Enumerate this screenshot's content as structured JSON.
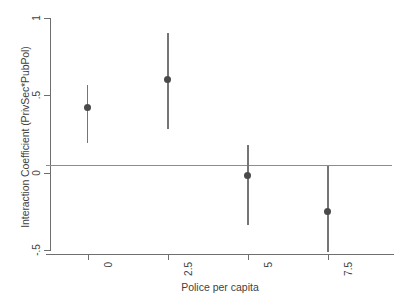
{
  "chart_data": {
    "type": "scatter",
    "title": "",
    "subtitle": "",
    "xlabel": "Police per capita",
    "ylabel": "Interaction Coefficient (PrivSec*PubPol)",
    "x": [
      0,
      2.5,
      5,
      7.5
    ],
    "xtick_labels": [
      "0",
      "2.5",
      "5",
      "7.5"
    ],
    "ytick_labels": [
      "1",
      ".5",
      "0",
      "-.5"
    ],
    "ytick_values": [
      1,
      0.5,
      0,
      -0.5
    ],
    "xlim": [
      -1.3,
      9.5
    ],
    "ylim": [
      -0.5,
      1
    ],
    "grid": false,
    "legend": false,
    "legend_position": "none",
    "series": [
      {
        "name": "Interaction Coefficient (PrivSec*PubPol)",
        "marker": "filled-circle",
        "color": "#4a4a4a",
        "errorbar_color": "#757575",
        "values": [
          0.42,
          0.6,
          -0.02,
          -0.25
        ],
        "ci_low": [
          0.19,
          0.28,
          -0.34,
          -0.51
        ],
        "ci_high": [
          0.57,
          0.9,
          0.18,
          0.04
        ]
      }
    ],
    "annotations": [
      {
        "name": "zero-reference-line",
        "type": "hline",
        "y": 0,
        "color": "#8d8d8d"
      }
    ]
  },
  "axis": {
    "y_title": "Interaction Coefficient (PrivSec*PubPol)",
    "x_title": "Police per capita",
    "y_ticks": [
      {
        "label": "1",
        "value": 1
      },
      {
        "label": ".5",
        "value": 0.5
      },
      {
        "label": "0",
        "value": 0
      },
      {
        "label": "-.5",
        "value": -0.5
      }
    ],
    "x_ticks": [
      {
        "label": "0",
        "value": 0
      },
      {
        "label": "2.5",
        "value": 2.5
      },
      {
        "label": "5",
        "value": 5
      },
      {
        "label": "7.5",
        "value": 7.5
      }
    ]
  },
  "colors": {
    "marker": "#4a4a4a",
    "errorbar": "#757575",
    "axis": "#6e6e6e",
    "zero_line": "#8d8d8d",
    "text": "#3f3f3f",
    "background": "#ffffff"
  }
}
